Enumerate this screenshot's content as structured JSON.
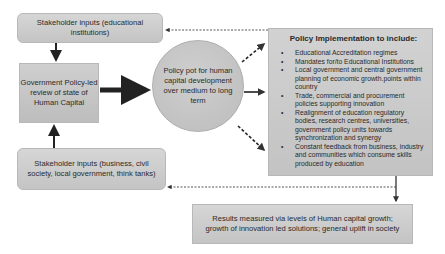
{
  "nodes": {
    "stakeholder_top": "Stakeholder inputs (educational institutions)",
    "gov_review": "Government Policy-led review of state of Human Capital",
    "stakeholder_bottom": "Stakeholder inputs (business, civil society, local government, think tanks)",
    "policy_pot": "Policy pot for human capital development over medium to long term",
    "implementation": {
      "title": "Policy Implementation to include:",
      "items": [
        "Educational Accreditation regimes",
        "Mandates for/to Educational Institutions",
        "Local government and central government planning of economic growth.points within country",
        "Trade, commercial and procurement policies supporting innovation",
        "Realignment of education regulatory bodies, research centres, universities, government policy units towards synchronization and synergy",
        "Constant feedback from business, industry and communities which consume skills produced by education"
      ]
    },
    "results": "Results measured via levels of Human capital growth; growth of innovation led solutions; general uplift in society"
  },
  "edges": [
    {
      "from": "stakeholder_top",
      "to": "gov_review",
      "style": "solid"
    },
    {
      "from": "stakeholder_bottom",
      "to": "gov_review",
      "style": "solid"
    },
    {
      "from": "gov_review",
      "to": "policy_pot",
      "style": "thick-solid"
    },
    {
      "from": "policy_pot",
      "to": "implementation",
      "style": "dashed"
    },
    {
      "from": "policy_pot",
      "to": "implementation",
      "style": "solid"
    },
    {
      "from": "policy_pot",
      "to": "implementation",
      "style": "dashed"
    },
    {
      "from": "implementation",
      "to": "results",
      "style": "solid"
    },
    {
      "from": "implementation",
      "to": "stakeholder_top",
      "style": "dotted-feedback"
    },
    {
      "from": "implementation",
      "to": "stakeholder_bottom",
      "style": "dotted-feedback"
    }
  ]
}
